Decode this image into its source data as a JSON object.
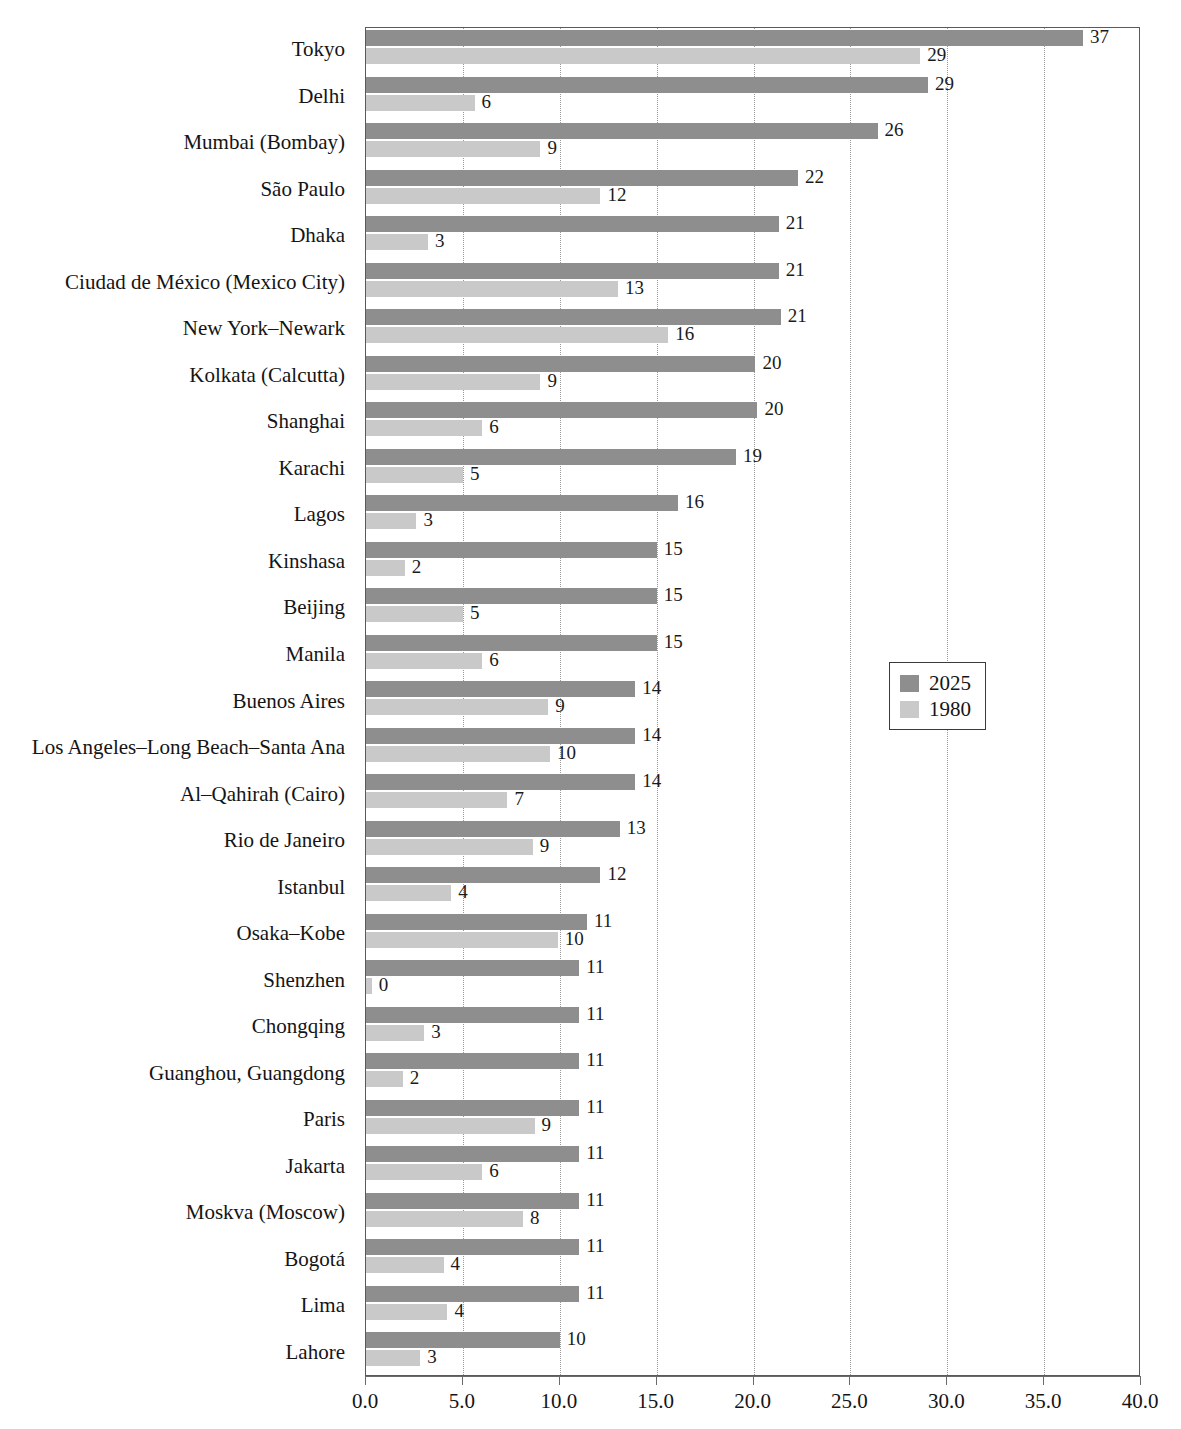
{
  "chart_data": {
    "type": "bar",
    "orientation": "horizontal",
    "title": "",
    "subtitle": "",
    "xlabel": "",
    "ylabel": "",
    "xlim": [
      0.0,
      40.0
    ],
    "xticks": [
      "0.0",
      "5.0",
      "10.0",
      "15.0",
      "20.0",
      "25.0",
      "30.0",
      "35.0",
      "40.0"
    ],
    "xtick_values": [
      0,
      5,
      10,
      15,
      20,
      25,
      30,
      35,
      40
    ],
    "grid": "vertical-dotted",
    "legend_position": "middle-right",
    "categories": [
      "Tokyo",
      "Delhi",
      "Mumbai (Bombay)",
      "São Paulo",
      "Dhaka",
      "Ciudad de México (Mexico City)",
      "New York–Newark",
      "Kolkata (Calcutta)",
      "Shanghai",
      "Karachi",
      "Lagos",
      "Kinshasa",
      "Beijing",
      "Manila",
      "Buenos Aires",
      "Los Angeles–Long Beach–Santa Ana",
      "Al–Qahirah (Cairo)",
      "Rio de Janeiro",
      "Istanbul",
      "Osaka–Kobe",
      "Shenzhen",
      "Chongqing",
      "Guanghou, Guangdong",
      "Paris",
      "Jakarta",
      "Moskva (Moscow)",
      "Bogotá",
      "Lima",
      "Lahore"
    ],
    "series": [
      {
        "name": "2025",
        "color": "#8e8e8e",
        "values": [
          37.0,
          29.0,
          26.4,
          22.3,
          21.3,
          21.3,
          21.4,
          20.1,
          20.2,
          19.1,
          16.1,
          15.0,
          15.0,
          15.0,
          13.9,
          13.9,
          13.9,
          13.1,
          12.1,
          11.4,
          11.0,
          11.0,
          11.0,
          11.0,
          11.0,
          11.0,
          11.0,
          11.0,
          10.0
        ],
        "labels": [
          "37",
          "29",
          "26",
          "22",
          "21",
          "21",
          "21",
          "20",
          "20",
          "19",
          "16",
          "15",
          "15",
          "15",
          "14",
          "14",
          "14",
          "13",
          "12",
          "11",
          "11",
          "11",
          "11",
          "11",
          "11",
          "11",
          "11",
          "11",
          "10"
        ]
      },
      {
        "name": "1980",
        "color": "#c9c9c9",
        "values": [
          28.6,
          5.6,
          9.0,
          12.1,
          3.2,
          13.0,
          15.6,
          9.0,
          6.0,
          5.0,
          2.6,
          2.0,
          5.0,
          6.0,
          9.4,
          9.5,
          7.3,
          8.6,
          4.4,
          9.9,
          0.3,
          3.0,
          1.9,
          8.7,
          6.0,
          8.1,
          4.0,
          4.2,
          2.8
        ],
        "labels": [
          "29",
          "6",
          "9",
          "12",
          "3",
          "13",
          "16",
          "9",
          "6",
          "5",
          "3",
          "2",
          "5",
          "6",
          "9",
          "10",
          "7",
          "9",
          "4",
          "10",
          "0",
          "3",
          "2",
          "9",
          "6",
          "8",
          "4",
          "4",
          "3"
        ]
      }
    ],
    "legend": [
      {
        "label": "2025",
        "color": "#8e8e8e"
      },
      {
        "label": "1980",
        "color": "#c9c9c9"
      }
    ]
  }
}
